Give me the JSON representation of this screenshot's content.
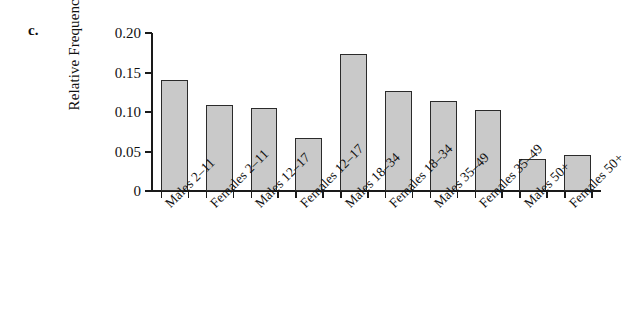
{
  "panel": {
    "label": "c."
  },
  "chart_data": {
    "type": "bar",
    "title": "",
    "xlabel": "",
    "ylabel": "Relative Frequency",
    "ylim": [
      0,
      0.2
    ],
    "ytick_labels": [
      "0.20",
      "0.15",
      "0.10",
      "0.05",
      "0"
    ],
    "ytick_values": [
      0.2,
      0.15,
      0.1,
      0.05,
      0
    ],
    "grid": false,
    "legend": null,
    "categories": [
      "Males 2–11",
      "Females 2–11",
      "Males 12–17",
      "Females 12–17",
      "Males 18–34",
      "Females 18–34",
      "Males 35–49",
      "Females 35–49",
      "Males 50+",
      "Females 50+"
    ],
    "values": [
      0.14,
      0.109,
      0.105,
      0.067,
      0.174,
      0.127,
      0.114,
      0.103,
      0.041,
      0.046
    ],
    "bar_color": "#c9c9c9",
    "bar_edge_color": "#2b2b2b",
    "axis_color": "#1a1a1a"
  }
}
